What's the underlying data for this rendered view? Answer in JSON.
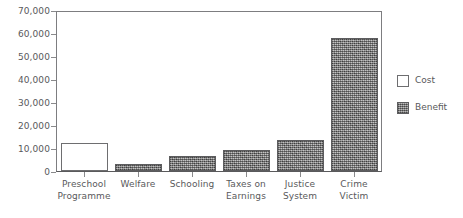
{
  "chart_data": {
    "type": "bar",
    "title": "",
    "subtitle": "",
    "xlabel": "",
    "ylabel": "",
    "ylim": [
      0,
      70000
    ],
    "ytick_interval": 10000,
    "grid": false,
    "legend_position": "right",
    "categories": [
      "Preschool\nProgramme",
      "Welfare",
      "Schooling",
      "Taxes on\nEarnings",
      "Justice\nSystem",
      "Crime\nVictim"
    ],
    "values": [
      12200,
      3100,
      6600,
      9200,
      13400,
      58000
    ],
    "series_of_point": [
      "Cost",
      "Benefit",
      "Benefit",
      "Benefit",
      "Benefit",
      "Benefit"
    ],
    "ytick_labels": [
      "70,000",
      "60,000",
      "50,000",
      "40,000",
      "30,000",
      "20,000",
      "10,000",
      "0"
    ],
    "ytick_values": [
      70000,
      60000,
      50000,
      40000,
      30000,
      20000,
      10000,
      0
    ],
    "legend": [
      {
        "label": "Cost",
        "swatch": "cost"
      },
      {
        "label": "Benefit",
        "swatch": "benefit"
      }
    ],
    "colors": {
      "cost_fill": "#ffffff",
      "cost_border": "#6e6e70",
      "benefit_fill": "#8b8b8b",
      "benefit_border": "#5d5d5f",
      "axis": "#7d7d80",
      "text": "#59595b",
      "background": "#ffffff"
    }
  }
}
